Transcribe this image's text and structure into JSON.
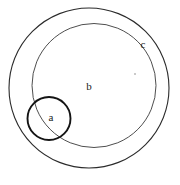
{
  "diagram": {
    "type": "euler-venn",
    "background_color": "#ffffff",
    "stroke_color": "#1a1a1a",
    "label_color": "#1a1a1a",
    "labels": {
      "a": "a",
      "b": "b",
      "c": "c"
    },
    "shapes": [
      {
        "name": "outer-circle",
        "label": "c",
        "cx": 89,
        "cy": 88,
        "r": 80,
        "stroke_width": 1.1,
        "stroke_color": "#2b2b2b",
        "fill": "none"
      },
      {
        "name": "middle-circle",
        "label": "b",
        "cx": 94,
        "cy": 85.5,
        "r": 62,
        "stroke_width": 0.9,
        "stroke_color": "#3a3a3a",
        "fill": "none"
      },
      {
        "name": "small-circle",
        "label": "a",
        "cx": 49,
        "cy": 118.5,
        "r": 21.5,
        "stroke_width": 1.9,
        "stroke_color": "#141414",
        "fill": "none"
      }
    ],
    "label_positions": {
      "a": {
        "x": 51,
        "y": 117
      },
      "b": {
        "x": 89,
        "y": 86
      },
      "c": {
        "x": 143,
        "y": 44
      }
    },
    "specks": [
      {
        "name": "speck-1",
        "x": 135,
        "y": 74,
        "color": "#b9b9b9"
      }
    ]
  }
}
